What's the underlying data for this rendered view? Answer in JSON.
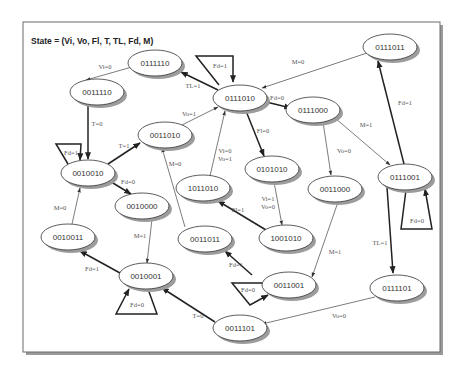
{
  "title": "State = (Vi, Vo, Fl, T, TL, Fd, M)",
  "nodes": [
    {
      "id": "n0111110",
      "label": "0111110",
      "x": 155,
      "y": 63
    },
    {
      "id": "n0011110",
      "label": "0011110",
      "x": 97,
      "y": 92
    },
    {
      "id": "n0111010",
      "label": "0111010",
      "x": 240,
      "y": 98
    },
    {
      "id": "n0111011",
      "label": "0111011",
      "x": 390,
      "y": 47
    },
    {
      "id": "n0111000",
      "label": "0111000",
      "x": 313,
      "y": 110
    },
    {
      "id": "n0011010",
      "label": "0011010",
      "x": 165,
      "y": 135
    },
    {
      "id": "n0010010",
      "label": "0010010",
      "x": 88,
      "y": 173
    },
    {
      "id": "n1011010",
      "label": "1011010",
      "x": 203,
      "y": 188
    },
    {
      "id": "n0101010",
      "label": "0101010",
      "x": 272,
      "y": 169
    },
    {
      "id": "n0011000",
      "label": "0011000",
      "x": 335,
      "y": 189
    },
    {
      "id": "n0111001",
      "label": "0111001",
      "x": 405,
      "y": 177
    },
    {
      "id": "n0010000",
      "label": "0010000",
      "x": 142,
      "y": 206
    },
    {
      "id": "n0010011",
      "label": "0010011",
      "x": 68,
      "y": 237
    },
    {
      "id": "n0011011",
      "label": "0011011",
      "x": 205,
      "y": 239
    },
    {
      "id": "n1001010",
      "label": "1001010",
      "x": 286,
      "y": 238
    },
    {
      "id": "n0010001",
      "label": "0010001",
      "x": 146,
      "y": 276
    },
    {
      "id": "n0011001",
      "label": "0011001",
      "x": 269,
      "y": 285
    },
    {
      "id": "n0111101",
      "label": "0111101",
      "x": 397,
      "y": 288
    },
    {
      "id": "n0011101",
      "label": "0011101",
      "x": 240,
      "y": 328
    }
  ],
  "edges": [
    {
      "from": "0111110",
      "to": "0011110",
      "label": "Vi=0",
      "weight": "thin"
    },
    {
      "from": "0011110",
      "to": "0010010",
      "label": "T=0",
      "weight": "thick"
    },
    {
      "from": "0111010",
      "to": "0111110",
      "label": "TL=1",
      "weight": "thick"
    },
    {
      "from": "0111010",
      "to": "0111010",
      "label": "Fd=1",
      "weight": "thick",
      "self_loop": true
    },
    {
      "from": "0111011",
      "to": "0111010",
      "label": "M=0",
      "weight": "thin"
    },
    {
      "from": "0111010",
      "to": "0111000",
      "label": "Fd=0",
      "weight": "thick"
    },
    {
      "from": "0011010",
      "to": "0111010",
      "label": "Vo=1",
      "weight": "thin"
    },
    {
      "from": "0111010",
      "to": "0101010",
      "label": "Fl=0",
      "weight": "thick"
    },
    {
      "from": "1011010",
      "to": "0111010",
      "label": "Vi=0\nVo=1",
      "weight": "thin"
    },
    {
      "from": "0010010",
      "to": "0011010",
      "label": "T=1",
      "weight": "thick"
    },
    {
      "from": "0010010",
      "to": "0010010",
      "label": "Fd=1",
      "weight": "thick",
      "self_loop": true
    },
    {
      "from": "0010010",
      "to": "0010000",
      "label": "Fd=0",
      "weight": "thick"
    },
    {
      "from": "0010011",
      "to": "0010010",
      "label": "M=0",
      "weight": "thin"
    },
    {
      "from": "0011011",
      "to": "0011010",
      "label": "M=0",
      "weight": "thin"
    },
    {
      "from": "0101010",
      "to": "1001010",
      "label": "Vi=1\nVo=0",
      "weight": "thin"
    },
    {
      "from": "1001010",
      "to": "1011010",
      "label": "Fl=1",
      "weight": "thick"
    },
    {
      "from": "0111000",
      "to": "0011000",
      "label": "Vo=0",
      "weight": "thin"
    },
    {
      "from": "0111000",
      "to": "0111001",
      "label": "M=1",
      "weight": "thin"
    },
    {
      "from": "0111001",
      "to": "0111011",
      "label": "Fd=1",
      "weight": "thick"
    },
    {
      "from": "0111001",
      "to": "0111001",
      "label": "Fd=0",
      "weight": "thick",
      "self_loop": true
    },
    {
      "from": "0111001",
      "to": "0111101",
      "label": "TL=1",
      "weight": "thick"
    },
    {
      "from": "0011000",
      "to": "0011001",
      "label": "M=1",
      "weight": "thin"
    },
    {
      "from": "0010000",
      "to": "0010001",
      "label": "M=1",
      "weight": "thin"
    },
    {
      "from": "0010001",
      "to": "0010011",
      "label": "Fd=1",
      "weight": "thick"
    },
    {
      "from": "0010001",
      "to": "0010001",
      "label": "Fd=0",
      "weight": "thick",
      "self_loop": true
    },
    {
      "from": "0011001",
      "to": "0011011",
      "label": "Fd=1",
      "weight": "thick"
    },
    {
      "from": "0011001",
      "to": "0011001",
      "label": "Fd=0",
      "weight": "thick",
      "self_loop": true
    },
    {
      "from": "0011101",
      "to": "0010001",
      "label": "T=0",
      "weight": "thick"
    },
    {
      "from": "0111101",
      "to": "0011101",
      "label": "Vo=0",
      "weight": "thin"
    }
  ],
  "edge_labels": {
    "e_0111110_0011110": "Vi=0",
    "e_0011110_0010010": "T=0",
    "e_0111010_0111110": "TL=1",
    "e_0111010_self": "Fd=1",
    "e_0111011_0111010": "M=0",
    "e_0111010_0111000": "Fd=0",
    "e_0011010_0111010": "Vo=1",
    "e_0111010_0101010": "Fl=0",
    "e_1011010_0111010_a": "Vi=0",
    "e_1011010_0111010_b": "Vo=1",
    "e_0010010_0011010": "T=1",
    "e_0010010_self": "Fd=1",
    "e_0010010_0010000": "Fd=0",
    "e_0010011_0010010": "M=0",
    "e_0011011_0011010": "M=0",
    "e_0101010_1001010_a": "Vi=1",
    "e_0101010_1001010_b": "Vo=0",
    "e_1001010_1011010": "Fl=1",
    "e_0111000_0011000": "Vo=0",
    "e_0111000_0111001": "M=1",
    "e_0111001_0111011": "Fd=1",
    "e_0111001_self": "Fd=0",
    "e_0111001_0111101": "TL=1",
    "e_0011000_0011001": "M=1",
    "e_0010000_0010001": "M=1",
    "e_0010001_0010011": "Fd=1",
    "e_0010001_self": "Fd=0",
    "e_0011001_0011011": "Fd=1",
    "e_0011001_self": "Fd=0",
    "e_0011101_0010001": "T=0",
    "e_0111101_0011101": "Vo=0"
  }
}
